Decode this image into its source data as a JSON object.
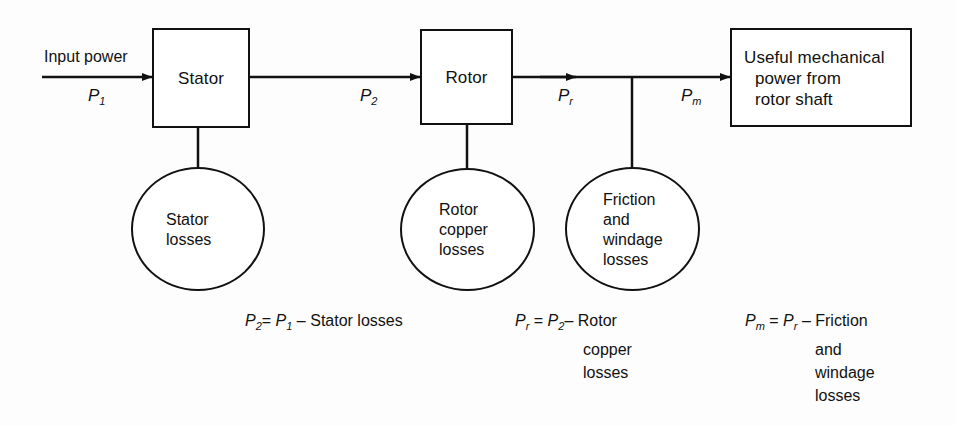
{
  "diagram": {
    "stroke_color": "#111111",
    "background_color": "#fdfdfd",
    "boxes": [
      {
        "id": "stator",
        "label": "Stator"
      },
      {
        "id": "rotor",
        "label": "Rotor"
      },
      {
        "id": "output",
        "line1": "Useful mechanical",
        "line2": "power from",
        "line3": "rotor shaft"
      }
    ],
    "circles": [
      {
        "id": "stator-losses",
        "label": "Stator\nlosses"
      },
      {
        "id": "rotor-copper-losses",
        "label": "Rotor\ncopper\nlosses"
      },
      {
        "id": "friction-windage-losses",
        "label": "Friction\nand\nwindage\nlosses"
      }
    ],
    "flow": {
      "input_label": "Input power",
      "p1": {
        "sym": "P",
        "sub": "1"
      },
      "p2": {
        "sym": "P",
        "sub": "2"
      },
      "pr": {
        "sym": "P",
        "sub": "r"
      },
      "pm": {
        "sym": "P",
        "sub": "m"
      }
    },
    "equations": [
      {
        "id": "eq-p2",
        "lhs_sym": "P",
        "lhs_sub": "2",
        "eq": "=",
        "rhs_sym": "P",
        "rhs_sub": "1",
        "minus": "–",
        "term_line1": "Stator losses",
        "term_line2": "",
        "term_line3": "",
        "term_line4": ""
      },
      {
        "id": "eq-pr",
        "lhs_sym": "P",
        "lhs_sub": "r",
        "eq": "=",
        "rhs_sym": "P",
        "rhs_sub": "2",
        "minus": "–",
        "term_line1": "Rotor",
        "term_line2": "copper",
        "term_line3": "losses",
        "term_line4": ""
      },
      {
        "id": "eq-pm",
        "lhs_sym": "P",
        "lhs_sub": "m",
        "eq": "=",
        "rhs_sym": "P",
        "rhs_sub": "r",
        "minus": "–",
        "term_line1": "Friction",
        "term_line2": "and",
        "term_line3": "windage",
        "term_line4": "losses"
      }
    ]
  }
}
